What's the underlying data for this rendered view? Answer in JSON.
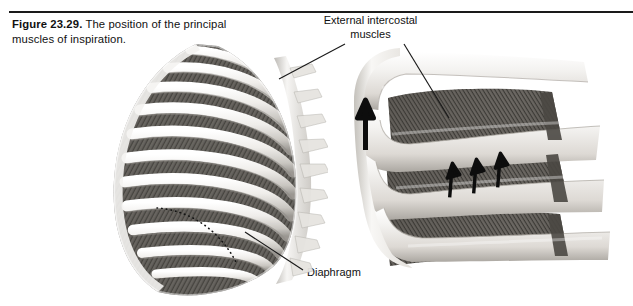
{
  "figure": {
    "number": "Figure 23.29.",
    "caption": "The position of the principal muscles of inspiration."
  },
  "labels": {
    "external_intercostal": "External intercostal muscles",
    "diaphragm": "Diaphragm"
  },
  "illustrations": {
    "ribcage": {
      "name": "rib-cage-lateral-view",
      "description": "Lateral view of the rib cage with external intercostal muscles filling the intercostal spaces; a dotted line marks the dome of the diaphragm.",
      "rib_count": 11,
      "has_diaphragm_dotted_line": true
    },
    "closeup": {
      "name": "intercostal-muscle-closeup",
      "description": "Magnified view of three intercostal spaces between four ribs showing the oblique fiber direction of the external intercostal muscles.",
      "rib_count": 4,
      "muscle_space_count": 3,
      "fiber_arrow_count": 3,
      "elevation_arrow_count": 1
    }
  },
  "colors": {
    "page_background": "#ffffff",
    "rule": "#1a1a1a",
    "text": "#111111",
    "leader_line": "#1a1a1a",
    "bone_light": "#f2f1ef",
    "bone_mid": "#d8d6d2",
    "bone_shadow": "#a9a6a1",
    "muscle_dark": "#4a4845",
    "muscle_mid": "#6d6a66",
    "muscle_light": "#8f8c87",
    "arrow": "#0d0d0d"
  }
}
